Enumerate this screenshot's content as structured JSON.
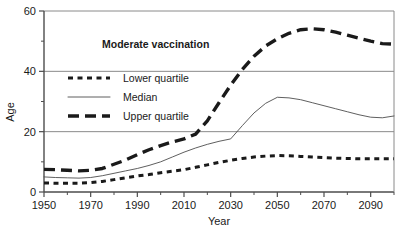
{
  "chart_data": {
    "type": "line",
    "title": "Moderate vaccination",
    "xlabel": "Year",
    "ylabel": "Age",
    "xlim": [
      1950,
      2100
    ],
    "ylim": [
      0,
      60
    ],
    "grid": true,
    "gridlines_y": [
      20,
      40,
      60
    ],
    "xticks": [
      1950,
      1970,
      1990,
      2010,
      2030,
      2050,
      2070,
      2090
    ],
    "xtick_labels": [
      "1950",
      "1970",
      "1990",
      "2010",
      "2030",
      "2050",
      "2070",
      "2090"
    ],
    "xticks_minor": [
      1960,
      1980,
      2000,
      2020,
      2040,
      2060,
      2080,
      2100
    ],
    "yticks": [
      0,
      20,
      40,
      60
    ],
    "ytick_labels": [
      "0",
      "20",
      "40",
      "60"
    ],
    "legend_position": "upper-left-inside",
    "x": [
      1950,
      1955,
      1960,
      1965,
      1970,
      1975,
      1980,
      1985,
      1990,
      1995,
      2000,
      2005,
      2010,
      2015,
      2020,
      2025,
      2030,
      2035,
      2040,
      2045,
      2050,
      2055,
      2060,
      2065,
      2070,
      2075,
      2080,
      2085,
      2090,
      2095,
      2100
    ],
    "series": [
      {
        "name": "Upper quartile",
        "style": "thick-dashed",
        "color": "#1a1a1a",
        "values": [
          7.5,
          7.4,
          7.2,
          7.0,
          7.2,
          7.8,
          9.2,
          10.6,
          12.4,
          14.0,
          15.4,
          16.6,
          17.6,
          19.2,
          23.6,
          29.6,
          35.4,
          40.6,
          45.0,
          48.4,
          50.8,
          52.6,
          53.8,
          54.1,
          53.8,
          53.0,
          52.0,
          51.0,
          50.0,
          49.2,
          49.0
        ]
      },
      {
        "name": "Median",
        "style": "thin-solid",
        "color": "#4d4d4d",
        "values": [
          5.0,
          4.8,
          4.7,
          4.6,
          4.8,
          5.4,
          6.2,
          7.0,
          7.8,
          8.8,
          10.0,
          11.6,
          13.2,
          14.6,
          15.8,
          16.8,
          17.6,
          22.0,
          26.2,
          29.4,
          31.4,
          31.2,
          30.6,
          29.6,
          28.6,
          27.6,
          26.6,
          25.6,
          24.8,
          24.6,
          25.2
        ]
      },
      {
        "name": "Lower quartile",
        "style": "dotted",
        "color": "#1a1a1a",
        "values": [
          3.0,
          2.9,
          2.9,
          2.9,
          3.1,
          3.5,
          4.1,
          4.7,
          5.3,
          5.8,
          6.4,
          6.9,
          7.4,
          8.2,
          9.0,
          9.8,
          10.5,
          11.1,
          11.6,
          11.9,
          12.1,
          12.0,
          11.8,
          11.6,
          11.4,
          11.2,
          11.1,
          11.0,
          11.0,
          11.0,
          11.0
        ]
      }
    ],
    "legend_entries": [
      {
        "label": "Lower quartile",
        "style": "dotted"
      },
      {
        "label": "Median",
        "style": "thin-solid"
      },
      {
        "label": "Upper quartile",
        "style": "thick-dashed"
      }
    ]
  }
}
